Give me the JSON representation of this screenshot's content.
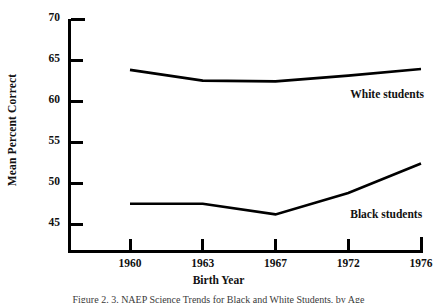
{
  "figure": {
    "caption": "Figure 2.  3. NAEP Science Trends for Black and White Students, by Age",
    "y_axis_title": "Mean Percent Correct",
    "x_axis_title": "Birth Year"
  },
  "chart_data": {
    "type": "line",
    "title": "",
    "xlabel": "Birth Year",
    "ylabel": "Mean Percent Correct",
    "categories": [
      "1960",
      "1963",
      "1967",
      "1972",
      "1976"
    ],
    "ylim": [
      41.5,
      70
    ],
    "yticks": [
      45,
      50,
      55,
      60,
      65,
      70
    ],
    "ytick_labels": [
      "45",
      "50",
      "55",
      "60",
      "65",
      "70"
    ],
    "grid": false,
    "legend": "inline-annotations",
    "series": [
      {
        "name": "White students",
        "label": "White students",
        "color": "#000000",
        "values": [
          63.8,
          62.5,
          62.4,
          63.1,
          63.9
        ]
      },
      {
        "name": "Black students",
        "label": "Black students",
        "color": "#000000",
        "values": [
          47.5,
          47.5,
          46.2,
          48.8,
          52.4
        ]
      }
    ],
    "annotations": [
      {
        "text": "White students",
        "x": "between 1972 and 1976",
        "y": 60.6
      },
      {
        "text": "Black students",
        "x": "between 1972 and 1976",
        "y": 46.0
      }
    ]
  }
}
